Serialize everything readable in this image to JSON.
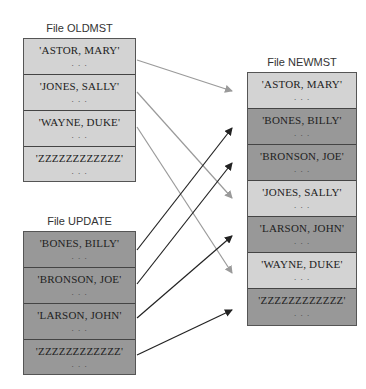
{
  "files": {
    "oldmst": {
      "title": "File OLDMST",
      "records": [
        {
          "name": "'ASTOR, MARY'",
          "dots": ". . ."
        },
        {
          "name": "'JONES, SALLY'",
          "dots": ". . ."
        },
        {
          "name": "'WAYNE, DUKE'",
          "dots": ". . ."
        },
        {
          "name": "'ZZZZZZZZZZZZ'",
          "dots": ". . ."
        }
      ]
    },
    "update": {
      "title": "File UPDATE",
      "records": [
        {
          "name": "'BONES, BILLY'",
          "dots": ". . ."
        },
        {
          "name": "'BRONSON, JOE'",
          "dots": ". . ."
        },
        {
          "name": "'LARSON, JOHN'",
          "dots": ". . ."
        },
        {
          "name": "'ZZZZZZZZZZZZ'",
          "dots": ". . ."
        }
      ]
    },
    "newmst": {
      "title": "File NEWMST",
      "records": [
        {
          "name": "'ASTOR, MARY'",
          "dots": ". . .",
          "source": "oldmst"
        },
        {
          "name": "'BONES, BILLY'",
          "dots": ". . .",
          "source": "update"
        },
        {
          "name": "'BRONSON, JOE'",
          "dots": ". . .",
          "source": "update"
        },
        {
          "name": "'JONES, SALLY'",
          "dots": ". . .",
          "source": "oldmst"
        },
        {
          "name": "'LARSON, JOHN'",
          "dots": ". . .",
          "source": "update"
        },
        {
          "name": "'WAYNE, DUKE'",
          "dots": ". . .",
          "source": "oldmst"
        },
        {
          "name": "'ZZZZZZZZZZZZ'",
          "dots": ". . .",
          "source": "update"
        }
      ]
    }
  },
  "colors": {
    "oldmst_fill": "#d3d3d3",
    "update_fill": "#989898",
    "old_arrow": "#9a9a9a",
    "update_arrow": "#222222"
  }
}
